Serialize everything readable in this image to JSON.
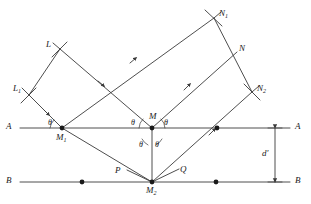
{
  "figure": {
    "type": "geometry-diagram",
    "background_color": "#ffffff",
    "line_color": "#3a3a3a",
    "text_color": "#1a1a1a"
  },
  "labels": {
    "plane_a_left": "A",
    "plane_a_right": "A",
    "plane_b_left": "B",
    "plane_b_right": "B",
    "incident_ray_upper": "L",
    "incident_ray_lower": "L",
    "incident_ray_lower_sub": "1",
    "reflected_ray_upper": "N",
    "reflected_ray_upper_sub": "1",
    "reflected_ray_middle": "N",
    "reflected_ray_lower": "N",
    "reflected_ray_lower_sub": "2",
    "point_m": "M",
    "point_m1": "M",
    "point_m1_sub": "1",
    "point_m2": "M",
    "point_m2_sub": "2",
    "point_p": "P",
    "point_q": "Q",
    "spacing": "d",
    "spacing_prime": "′",
    "angle_theta": "θ"
  },
  "angles": [
    {
      "name": "theta-at-m1-incident",
      "symbol": "θ",
      "x": 48,
      "y": 119
    },
    {
      "name": "theta-at-m-incident",
      "symbol": "θ",
      "x": 131,
      "y": 119
    },
    {
      "name": "theta-at-m-reflected",
      "symbol": "θ",
      "x": 163,
      "y": 119
    },
    {
      "name": "theta-at-m-lower-left",
      "symbol": "θ",
      "x": 139,
      "y": 141
    },
    {
      "name": "theta-at-m-lower-right",
      "symbol": "θ",
      "x": 154,
      "y": 141
    }
  ],
  "geometry": {
    "plane_a_y": 128,
    "plane_b_y": 182,
    "plane_a_x_start": 20,
    "plane_a_x_end": 290,
    "plane_b_x_start": 20,
    "plane_b_x_end": 290,
    "point_m1": [
      62,
      128
    ],
    "point_m": [
      152,
      128
    ],
    "point_m2": [
      152,
      182
    ],
    "point_p": [
      127,
      174
    ],
    "point_q": [
      177,
      174
    ],
    "dot_a_right": [
      217,
      128
    ],
    "dot_b_left": [
      82,
      182
    ],
    "dot_b_right": [
      216,
      182
    ],
    "spacing_arrow_x": 275,
    "incidence_angle_deg": 45
  },
  "points_marked": [
    {
      "name": "M1",
      "on_plane": "A"
    },
    {
      "name": "M",
      "on_plane": "A"
    },
    {
      "name": "M2",
      "on_plane": "B"
    }
  ]
}
